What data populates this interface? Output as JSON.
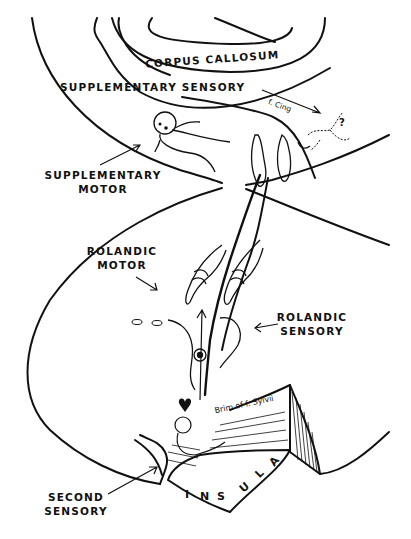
{
  "figure": {
    "line_color": "#111111",
    "background": "#ffffff"
  },
  "labels": {
    "corpus_callosum": "CORPUS CALLOSUM",
    "supplementary_sensory": "SUPPLEMENTARY SENSORY",
    "supplementary_motor_line1": "SUPPLEMENTARY",
    "supplementary_motor_line2": "MOTOR",
    "rolandic_motor_line1": "ROLANDIC",
    "rolandic_motor_line2": "MOTOR",
    "rolandic_sensory_line1": "ROLANDIC",
    "rolandic_sensory_line2": "SENSORY",
    "second_sensory_line1": "SECOND",
    "second_sensory_line2": "SENSORY",
    "f_cing": "f. Cing",
    "brim_f_sylvii": "Brim of f. Sylvii",
    "question_mark": "?",
    "insula_letters": [
      "I",
      "N",
      "S",
      "U",
      "L",
      "A"
    ]
  }
}
